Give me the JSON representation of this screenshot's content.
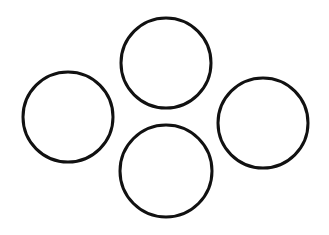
{
  "canvas": {
    "width": 329,
    "height": 235,
    "background": "#ffffff"
  },
  "style": {
    "stroke": "#111111",
    "stroke_width": 3,
    "fill": "none"
  },
  "circles": [
    {
      "name": "top-circle",
      "cx": 166,
      "cy": 63,
      "r": 45
    },
    {
      "name": "left-circle",
      "cx": 68,
      "cy": 117,
      "r": 45
    },
    {
      "name": "right-circle",
      "cx": 263,
      "cy": 123,
      "r": 45
    },
    {
      "name": "bottom-circle",
      "cx": 166,
      "cy": 171,
      "r": 46
    }
  ]
}
